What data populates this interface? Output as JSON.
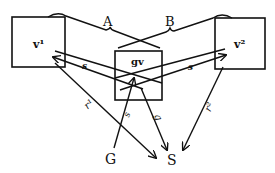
{
  "diagram": {
    "nodes": {
      "v1": {
        "label": "v¹"
      },
      "gv": {
        "label": "gv"
      },
      "v2": {
        "label": "v²"
      },
      "G": {
        "label": "G"
      },
      "S": {
        "label": "S"
      }
    },
    "brace_labels": {
      "A": "A",
      "B": "B"
    },
    "edge_labels": {
      "v1_gv_s": "s",
      "gv_v2_s": "s",
      "v1_S_r1": "r¹",
      "G_gv_s": "s",
      "gv_S_g": "g",
      "v2_S_r2": "r²"
    },
    "colors": {
      "ink": "#111111",
      "background": "#ffffff"
    }
  }
}
